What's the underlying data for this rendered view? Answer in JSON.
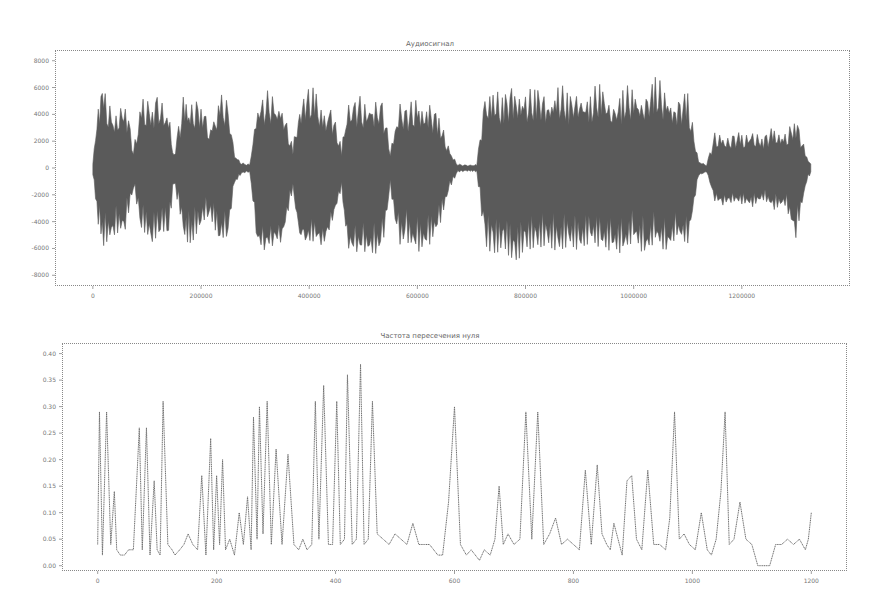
{
  "chart_data": [
    {
      "type": "area",
      "title": "Аудиосигнал",
      "xlabel": "",
      "ylabel": "",
      "xlim": [
        -70000,
        1400000
      ],
      "ylim": [
        -8800,
        8800
      ],
      "xticks": [
        0,
        200000,
        400000,
        600000,
        800000,
        1000000,
        1200000
      ],
      "xtick_labels": [
        "0",
        "200000",
        "400000",
        "600000",
        "800000",
        "1000000",
        "1200000"
      ],
      "yticks": [
        8000,
        6000,
        4000,
        2000,
        0,
        -2000,
        -4000,
        -6000,
        -8000
      ],
      "ytick_labels": [
        "8000",
        "6000",
        "4000",
        "2000",
        "0",
        "-2000",
        "-4000",
        "-6000",
        "-8000"
      ],
      "grid": false,
      "legend": null,
      "series": [
        {
          "name": "waveform envelope",
          "x": [
            0,
            10000,
            20000,
            40000,
            60000,
            75000,
            90000,
            110000,
            125000,
            140000,
            150000,
            170000,
            180000,
            200000,
            215000,
            235000,
            250000,
            262000,
            275000,
            290000,
            305000,
            320000,
            335000,
            350000,
            370000,
            380000,
            390000,
            410000,
            425000,
            440000,
            460000,
            470000,
            485000,
            500000,
            520000,
            535000,
            550000,
            565000,
            580000,
            600000,
            620000,
            640000,
            660000,
            675000,
            690000,
            700000,
            710000,
            725000,
            740000,
            760000,
            780000,
            800000,
            820000,
            840000,
            860000,
            880000,
            900000,
            920000,
            940000,
            960000,
            980000,
            1000000,
            1020000,
            1040000,
            1060000,
            1080000,
            1100000,
            1120000,
            1135000,
            1150000,
            1165000,
            1180000,
            1200000,
            1220000,
            1240000,
            1260000,
            1280000,
            1300000,
            1320000,
            1330000
          ],
          "upper": [
            500,
            5800,
            6200,
            4500,
            5600,
            1500,
            5900,
            5200,
            6000,
            4500,
            1200,
            6300,
            4800,
            5500,
            3500,
            5600,
            5200,
            1200,
            400,
            300,
            5600,
            5800,
            5700,
            5200,
            1500,
            5000,
            6200,
            6000,
            4800,
            5000,
            1500,
            5500,
            5500,
            5400,
            5500,
            5400,
            1500,
            5200,
            4800,
            5600,
            5000,
            4200,
            1500,
            300,
            250,
            250,
            300,
            6000,
            6500,
            5500,
            6800,
            6000,
            6200,
            5800,
            6500,
            5800,
            6300,
            5600,
            6800,
            5200,
            6000,
            6400,
            5800,
            7000,
            6200,
            5500,
            5800,
            600,
            300,
            2800,
            2600,
            2600,
            2700,
            3000,
            2500,
            3200,
            2800,
            4000,
            1000,
            200
          ],
          "lower": [
            -500,
            -4200,
            -5800,
            -5000,
            -4600,
            -1500,
            -4500,
            -5600,
            -4700,
            -4800,
            -1200,
            -5200,
            -5900,
            -4200,
            -3500,
            -5500,
            -5000,
            -1200,
            -400,
            -300,
            -6000,
            -6200,
            -5800,
            -5600,
            -1500,
            -5200,
            -6000,
            -5400,
            -6200,
            -4600,
            -1500,
            -6200,
            -6500,
            -6400,
            -6600,
            -6200,
            -1500,
            -5800,
            -5500,
            -6300,
            -5900,
            -4500,
            -1500,
            -300,
            -250,
            -250,
            -300,
            -5800,
            -6500,
            -6000,
            -7200,
            -6100,
            -6000,
            -5800,
            -6300,
            -5800,
            -6200,
            -5500,
            -6000,
            -6200,
            -6400,
            -5400,
            -6600,
            -5500,
            -6400,
            -5200,
            -5800,
            -600,
            -300,
            -2500,
            -2800,
            -2600,
            -2700,
            -2900,
            -2400,
            -3100,
            -2800,
            -5200,
            -1000,
            -200
          ]
        }
      ]
    },
    {
      "type": "line",
      "title": "Частота пересечения нуля",
      "xlabel": "",
      "ylabel": "",
      "xlim": [
        -60,
        1260
      ],
      "ylim": [
        -0.01,
        0.42
      ],
      "xticks": [
        0,
        200,
        400,
        600,
        800,
        1000,
        1200
      ],
      "xtick_labels": [
        "0",
        "200",
        "400",
        "600",
        "800",
        "1000",
        "1200"
      ],
      "yticks": [
        0.4,
        0.35,
        0.3,
        0.25,
        0.2,
        0.15,
        0.1,
        0.05,
        0.0
      ],
      "ytick_labels": [
        "0.40",
        "0.35",
        "0.30",
        "0.25",
        "0.20",
        "0.15",
        "0.10",
        "0.05",
        "0.00"
      ],
      "grid": false,
      "legend": null,
      "series": [
        {
          "name": "zcr",
          "x": [
            0,
            3,
            8,
            15,
            22,
            28,
            32,
            38,
            45,
            52,
            60,
            70,
            75,
            82,
            88,
            95,
            100,
            105,
            110,
            118,
            125,
            130,
            138,
            145,
            152,
            160,
            168,
            175,
            182,
            190,
            195,
            200,
            205,
            210,
            215,
            222,
            230,
            238,
            245,
            252,
            258,
            262,
            268,
            272,
            278,
            285,
            292,
            300,
            310,
            320,
            330,
            338,
            345,
            352,
            360,
            366,
            372,
            380,
            388,
            395,
            402,
            408,
            415,
            420,
            428,
            435,
            442,
            448,
            455,
            462,
            470,
            480,
            490,
            500,
            510,
            520,
            530,
            540,
            550,
            558,
            565,
            572,
            580,
            590,
            600,
            610,
            620,
            628,
            635,
            642,
            650,
            660,
            668,
            675,
            682,
            690,
            700,
            710,
            720,
            730,
            740,
            750,
            760,
            770,
            780,
            790,
            800,
            810,
            820,
            830,
            840,
            848,
            856,
            862,
            868,
            875,
            882,
            890,
            898,
            906,
            915,
            925,
            935,
            945,
            955,
            962,
            970,
            978,
            986,
            995,
            1005,
            1015,
            1025,
            1032,
            1040,
            1048,
            1055,
            1062,
            1070,
            1080,
            1090,
            1100,
            1110,
            1120,
            1130,
            1140,
            1150,
            1160,
            1170,
            1180,
            1190,
            1195,
            1200
          ],
          "y": [
            0.04,
            0.29,
            0.02,
            0.29,
            0.04,
            0.14,
            0.03,
            0.02,
            0.02,
            0.03,
            0.03,
            0.26,
            0.03,
            0.26,
            0.02,
            0.16,
            0.03,
            0.02,
            0.31,
            0.04,
            0.03,
            0.02,
            0.03,
            0.04,
            0.06,
            0.04,
            0.03,
            0.17,
            0.02,
            0.24,
            0.03,
            0.17,
            0.04,
            0.2,
            0.03,
            0.05,
            0.02,
            0.1,
            0.04,
            0.13,
            0.03,
            0.28,
            0.05,
            0.3,
            0.06,
            0.31,
            0.04,
            0.22,
            0.04,
            0.21,
            0.04,
            0.03,
            0.05,
            0.03,
            0.04,
            0.31,
            0.05,
            0.34,
            0.04,
            0.04,
            0.31,
            0.04,
            0.05,
            0.36,
            0.04,
            0.05,
            0.38,
            0.04,
            0.05,
            0.31,
            0.06,
            0.05,
            0.04,
            0.06,
            0.05,
            0.04,
            0.08,
            0.04,
            0.04,
            0.04,
            0.03,
            0.02,
            0.02,
            0.12,
            0.3,
            0.04,
            0.02,
            0.03,
            0.02,
            0.01,
            0.03,
            0.02,
            0.05,
            0.15,
            0.04,
            0.06,
            0.04,
            0.05,
            0.29,
            0.05,
            0.29,
            0.04,
            0.06,
            0.09,
            0.04,
            0.05,
            0.04,
            0.03,
            0.18,
            0.04,
            0.19,
            0.06,
            0.04,
            0.03,
            0.08,
            0.05,
            0.02,
            0.16,
            0.17,
            0.05,
            0.03,
            0.18,
            0.04,
            0.04,
            0.03,
            0.09,
            0.29,
            0.05,
            0.06,
            0.04,
            0.03,
            0.1,
            0.03,
            0.02,
            0.05,
            0.14,
            0.29,
            0.04,
            0.05,
            0.12,
            0.05,
            0.04,
            0.0,
            0.0,
            0.0,
            0.04,
            0.04,
            0.05,
            0.04,
            0.05,
            0.03,
            0.05,
            0.1,
            0.02,
            0.04
          ]
        }
      ]
    }
  ],
  "charts": {
    "top": {
      "title": "Аудиосигнал"
    },
    "bottom": {
      "title": "Частота пересечения нуля"
    }
  },
  "colors": {
    "waveform": "#5a5a5a",
    "zcr_line": "#6e6e6e",
    "frame": "#888888",
    "text": "#777777"
  }
}
